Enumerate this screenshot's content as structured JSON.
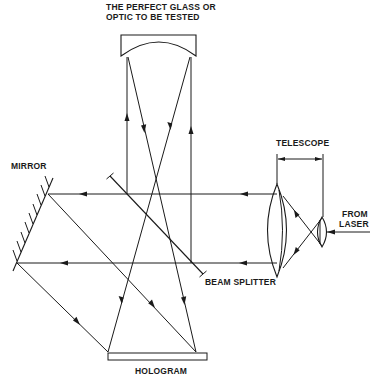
{
  "diagram": {
    "type": "holographic interferometry optical setup",
    "labels": {
      "test_optic_line1": "THE PERFECT GLASS OR",
      "test_optic_line2": "OPTIC TO BE TESTED",
      "mirror": "MIRROR",
      "telescope": "TELESCOPE",
      "from_laser_line1": "FROM",
      "from_laser_line2": "LASER",
      "beam_splitter": "BEAM SPLITTER",
      "hologram": "HOLOGRAM"
    },
    "components": [
      {
        "id": "test-optic",
        "label": "THE PERFECT GLASS OR OPTIC TO BE TESTED"
      },
      {
        "id": "mirror",
        "label": "MIRROR"
      },
      {
        "id": "telescope",
        "label": "TELESCOPE"
      },
      {
        "id": "laser-source",
        "label": "FROM LASER"
      },
      {
        "id": "beam-splitter",
        "label": "BEAM SPLITTER"
      },
      {
        "id": "hologram",
        "label": "HOLOGRAM"
      }
    ],
    "colors": {
      "ink": "#1a1a1a",
      "background": "#ffffff"
    }
  }
}
